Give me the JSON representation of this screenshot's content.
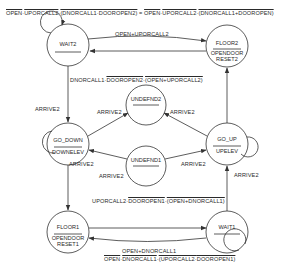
{
  "diagram": {
    "type": "state-transition-diagram",
    "states": [
      {
        "id": "wait2",
        "name": "WAIT2",
        "output_line1": "",
        "output_line2": ""
      },
      {
        "id": "floor2",
        "name": "FLOOR2",
        "output_line1": "OPENDOOR",
        "output_line2": "RESET2"
      },
      {
        "id": "undefnd2",
        "name": "UNDEFND2",
        "output_line1": "",
        "output_line2": ""
      },
      {
        "id": "go_down",
        "name": "GO_DOWN",
        "output_line1": "DOWNELEV",
        "output_line2": ""
      },
      {
        "id": "go_up",
        "name": "GO_UP",
        "output_line1": "UPELEV",
        "output_line2": ""
      },
      {
        "id": "undefnd1",
        "name": "UNDEFND1",
        "output_line1": "",
        "output_line2": ""
      },
      {
        "id": "floor1",
        "name": "FLOOR1",
        "output_line1": "OPENDOOR",
        "output_line2": "RESET1"
      },
      {
        "id": "wait1",
        "name": "WAIT1",
        "output_line1": "",
        "output_line2": ""
      }
    ],
    "labels": {
      "wait2_self": {
        "parts": [
          {
            "text": "OPEN",
            "over": true
          },
          {
            "text": "·",
            "over": false
          },
          {
            "text": "UPORCALL2",
            "over": true
          },
          {
            "text": "·",
            "over": false
          },
          {
            "text": "(DNORCALL1·DOOROPEN2)",
            "over": true
          },
          {
            "text": " = ",
            "over": false
          },
          {
            "text": "OPEN",
            "over": true
          },
          {
            "text": "·",
            "over": false
          },
          {
            "text": "UPORCALL2",
            "over": true
          },
          {
            "text": "·",
            "over": false
          },
          {
            "text": "(DNORCALL1+DOOROPEN)",
            "over": true
          }
        ]
      },
      "wait2_to_floor2": "OPEN+UPORCALL2",
      "wait2_to_go_down": {
        "parts": [
          {
            "text": "DNORCALL1·",
            "over": false
          },
          {
            "text": "DOOROPEN2",
            "over": true
          },
          {
            "text": "·",
            "over": false
          },
          {
            "text": "(OPEN+UPORCALL2)",
            "over": true
          }
        ]
      },
      "go_down_self": "ARRIVE2",
      "go_down_to_undefnd2": "ARRIVE2",
      "go_up_to_undefnd2": "ARRIVE2",
      "go_down_to_floor1": "ARRIVE2",
      "undefnd1_to_go_down": "ARRIVE2",
      "undefnd1_to_go_up": "ARRIVE2",
      "go_up_self": "ARRIVE2",
      "wait1_to_go_up": {
        "parts": [
          {
            "text": "UPORCALL2·",
            "over": false
          },
          {
            "text": "DOOROPEN1",
            "over": true
          },
          {
            "text": "·",
            "over": false
          },
          {
            "text": "(OPEN+DNORCALL1)",
            "over": true
          }
        ]
      },
      "wait1_to_floor1": "OPEN+DNORCALL1",
      "wait1_self": {
        "parts": [
          {
            "text": "OPEN",
            "over": true
          },
          {
            "text": "·",
            "over": false
          },
          {
            "text": "DNORCALL1",
            "over": true
          },
          {
            "text": "·",
            "over": false
          },
          {
            "text": "(UPORCALL2·",
            "over": true
          },
          {
            "text": "DOOROPEN1)",
            "over": true
          }
        ]
      }
    },
    "transitions": [
      {
        "from": "wait2",
        "to": "wait2",
        "label_key": "wait2_self"
      },
      {
        "from": "wait2",
        "to": "floor2",
        "label_key": "wait2_to_floor2"
      },
      {
        "from": "floor2",
        "to": "wait2",
        "label_key": ""
      },
      {
        "from": "wait2",
        "to": "go_down",
        "label_key": "wait2_to_go_down"
      },
      {
        "from": "go_down",
        "to": "go_down",
        "label_key": "go_down_self"
      },
      {
        "from": "go_down",
        "to": "undefnd2",
        "label_key": "go_down_to_undefnd2"
      },
      {
        "from": "go_up",
        "to": "undefnd2",
        "label_key": "go_up_to_undefnd2"
      },
      {
        "from": "undefnd1",
        "to": "go_down",
        "label_key": "undefnd1_to_go_down"
      },
      {
        "from": "undefnd1",
        "to": "go_up",
        "label_key": "undefnd1_to_go_up"
      },
      {
        "from": "go_up",
        "to": "go_up",
        "label_key": "go_up_self"
      },
      {
        "from": "go_up",
        "to": "floor2",
        "label_key": ""
      },
      {
        "from": "go_down",
        "to": "floor1",
        "label_key": "go_down_to_floor1"
      },
      {
        "from": "wait1",
        "to": "go_up",
        "label_key": "wait1_to_go_up"
      },
      {
        "from": "floor1",
        "to": "wait1",
        "label_key": ""
      },
      {
        "from": "wait1",
        "to": "floor1",
        "label_key": "wait1_to_floor1"
      },
      {
        "from": "wait1",
        "to": "wait1",
        "label_key": "wait1_self"
      }
    ]
  }
}
